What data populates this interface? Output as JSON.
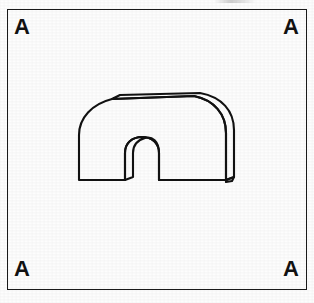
{
  "page": {
    "background_color": "#fdfdfd",
    "width": 314,
    "height": 303,
    "ink_color": "#121212"
  },
  "frame": {
    "name": "outer-border-rectangle",
    "stroke_color": "#1a1a1a",
    "stroke_width": 1.6,
    "x": 7,
    "y": 9,
    "width": 300,
    "height": 281
  },
  "corner_labels": {
    "top_left": "A",
    "top_right": "A",
    "bottom_left": "A",
    "bottom_right": "A"
  },
  "figure": {
    "name": "arch-tunnel-line-drawing",
    "stroke_color": "#121212",
    "stroke_width": 2.1,
    "fill": "none",
    "bounds": {
      "x": 76,
      "y": 95,
      "width": 160,
      "height": 86
    },
    "front_face_outline": "M 79,180 L 79,135 C 79,118 92,104 112,99 L 194,96 C 214,100 226,114 226,133 L 226,180 L 159,180 L 159,153 C 159,143 152,137 142,137 C 132,137 125,143 125,153 L 125,180 Z",
    "depth_top_edge": "M 112,99 L 120,95 L 200,93 C 222,97 234,111 234,130 L 234,177 L 226,180 L 226,133 C 226,114 214,100 194,96 Z",
    "inner_left_thickness": "M 125,180 L 133,177 L 133,153 C 133,145 138,140 145,138 C 152,136 159,141 159,153 L 159,180 L 159,153 C 159,143 152,137 142,137 C 132,137 125,143 125,153 Z",
    "right_base_notch": "M 226,180 L 234,177 L 232,181 L 226,182 Z"
  }
}
